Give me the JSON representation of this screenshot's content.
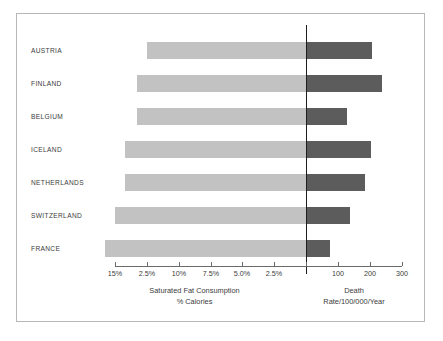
{
  "chart_data": {
    "type": "bar",
    "title": "",
    "subtitle": "",
    "orientation": "horizontal",
    "style": "bidirectional paired bar chart (back-to-back)",
    "categories": [
      "AUSTRIA",
      "FINLAND",
      "BELGIUM",
      "ICELAND",
      "NETHERLANDS",
      "SWITZERLAND",
      "FRANCE"
    ],
    "series": [
      {
        "name": "Saturated Fat Consumption",
        "units": "% Calories",
        "direction": "left",
        "axis_label": "Saturated Fat Consumption\n% Calories",
        "tick_labels": [
          "15%",
          "2.5%",
          "10%",
          "7.5%",
          "5.0%",
          "2.5%"
        ],
        "values": [
          8.2,
          10.6,
          10.6,
          12.4,
          12.4,
          13.8,
          15.5
        ],
        "color": "#c2c2c2"
      },
      {
        "name": "Death Rate",
        "units": "per 100/000/Year",
        "direction": "right",
        "axis_label": "Death Rate/100/000/Year",
        "tick_labels": [
          "100",
          "200",
          "300"
        ],
        "values": [
          205,
          235,
          130,
          200,
          185,
          135,
          77
        ],
        "color": "#5c5c5c"
      }
    ],
    "axis": {
      "left_title": "Saturated Fat Consumption\n% Calories",
      "right_title": "Death Rate/100/000/Year",
      "ticks": [
        {
          "label": "15%",
          "x": 114
        },
        {
          "label": "2.5%",
          "x": 146
        },
        {
          "label": "10%",
          "x": 178
        },
        {
          "label": "7.5%",
          "x": 210
        },
        {
          "label": "5.0%",
          "x": 241
        },
        {
          "label": "2.5%",
          "x": 273
        },
        {
          "label": "",
          "x": 305
        },
        {
          "label": "100",
          "x": 337
        },
        {
          "label": "200",
          "x": 369
        },
        {
          "label": "300",
          "x": 401
        }
      ],
      "divider_x": 305,
      "grid": false,
      "legend": "none"
    },
    "bars": [
      {
        "category": "AUSTRIA",
        "left_start": 146,
        "right_end": 371,
        "top": 28
      },
      {
        "category": "FINLAND",
        "left_start": 136,
        "right_end": 381,
        "top": 61
      },
      {
        "category": "BELGIUM",
        "left_start": 136,
        "right_end": 346,
        "top": 94
      },
      {
        "category": "ICELAND",
        "left_start": 124,
        "right_end": 370,
        "top": 127
      },
      {
        "category": "NETHERLANDS",
        "left_start": 124,
        "right_end": 364,
        "top": 160
      },
      {
        "category": "SWITZERLAND",
        "left_start": 114,
        "right_end": 349,
        "top": 193
      },
      {
        "category": "FRANCE",
        "left_start": 104,
        "right_end": 329,
        "top": 226
      }
    ],
    "colors": {
      "left_bar": "#c2c2c2",
      "right_bar": "#5c5c5c",
      "divider": "#1d1d1d",
      "axis": "#6a6a6a",
      "frame": "#b7b7b7",
      "text": "#3b3b3b"
    }
  }
}
